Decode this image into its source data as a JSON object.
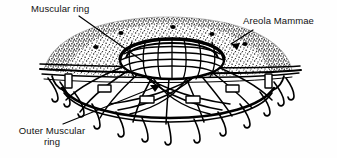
{
  "figure": {
    "type": "line-drawing",
    "background_color": "#fefefe",
    "ink_color": "#000000",
    "width": 337,
    "height": 158,
    "labels": {
      "muscular_ring": "Muscular ring",
      "areola_mammae": "Areola Mammae",
      "outer_muscular_ring_line1": "Outer Muscular",
      "outer_muscular_ring_line2": "ring"
    },
    "structures": {
      "areola_dome": {
        "name": "areola-dome",
        "fill": "stippled",
        "gland_dots": 5
      },
      "inner_muscular_ring": {
        "name": "inner-muscular-ring",
        "shape": "ellipse",
        "lattice": "crosshatch"
      },
      "outer_muscular_ring": {
        "name": "outer-muscular-ring",
        "shape": "ellipse-band",
        "connector_blocks": 6
      },
      "radial_fibers": {
        "name": "radial-fibers",
        "count": 14,
        "terminal_shape": "hook"
      },
      "horizontal_planes": {
        "name": "horizontal-plane-lines",
        "count": 4
      }
    },
    "leaders": {
      "muscular_ring": "diagonal down-right to inner ring",
      "areola_mammae": "diagonal down-left arrow into stipple",
      "outer_muscular_ring": "long diagonal up-right to outer band"
    }
  }
}
